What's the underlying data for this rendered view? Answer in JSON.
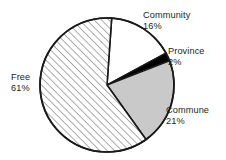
{
  "chart_data": {
    "type": "pie",
    "title": "",
    "subtitle": "",
    "xlabel": "",
    "ylabel": "",
    "legend_position": "none",
    "grid": false,
    "labels_show_percent": true,
    "start_angle_deg": 4,
    "direction": "clockwise",
    "categories": [
      "Community",
      "Province",
      "Commune",
      "Free"
    ],
    "values": [
      16,
      2,
      21,
      61
    ],
    "units": "%",
    "slices": [
      {
        "name": "Community",
        "label": "Community",
        "value": 16,
        "value_text": "16%",
        "fill": "#ffffff",
        "pattern": "solid",
        "stroke": "#1a1a1a"
      },
      {
        "name": "Province",
        "label": "Province",
        "value": 2,
        "value_text": "2%",
        "fill": "#000000",
        "pattern": "solid",
        "stroke": "#1a1a1a"
      },
      {
        "name": "Commune",
        "label": "Commune",
        "value": 21,
        "value_text": "21%",
        "fill": "#c9c9c9",
        "pattern": "solid",
        "stroke": "#1a1a1a"
      },
      {
        "name": "Free",
        "label": "Free",
        "value": 61,
        "value_text": "61%",
        "fill": "#ffffff",
        "pattern": "diagonal-hatch",
        "stroke": "#1a1a1a"
      }
    ]
  },
  "geometry": {
    "center_x": 107,
    "center_y": 85,
    "radius": 67
  },
  "style": {
    "background": "#ffffff",
    "text_color": "#231f20",
    "outline_color": "#1a1a1a",
    "hatch_color": "#3c3c3c",
    "gray_fill": "#c9c9c9",
    "black_fill": "#000000"
  }
}
